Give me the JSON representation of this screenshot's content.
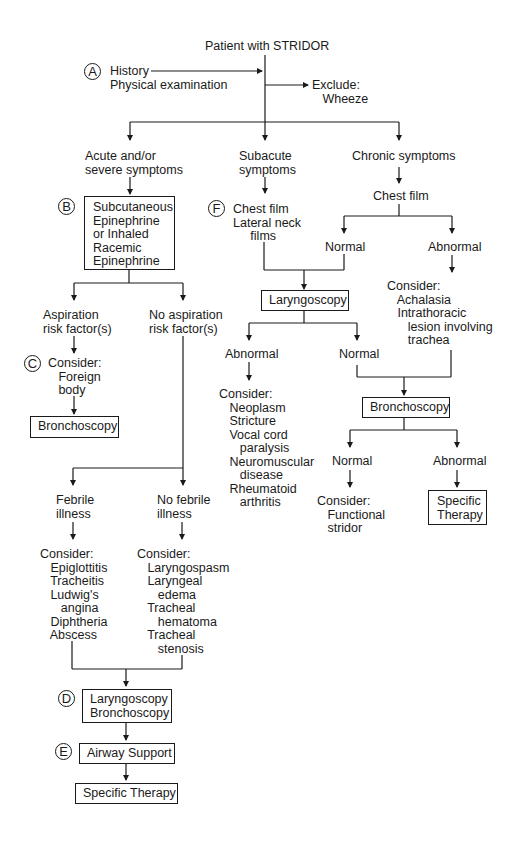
{
  "diagram": {
    "title": "Patient with STRIDOR",
    "step_labels": {
      "A": "A",
      "B": "B",
      "C": "C",
      "D": "D",
      "E": "E",
      "F": "F"
    },
    "top": {
      "history": "History\nPhysical examination",
      "exclude": "Exclude:\n   Wheeze"
    },
    "branches": {
      "acute": "Acute and/or\nsevere symptoms",
      "subacute": "Subacute\nsymptoms",
      "chronic": "Chronic symptoms"
    },
    "acute_path": {
      "treatment_box": "Subcutaneous\nEpinephrine\nor Inhaled\nRacemic\nEpinephrine",
      "aspiration": "Aspiration\nrisk factor(s)",
      "no_aspiration": "No aspiration\nrisk factor(s)",
      "consider_foreign": "Consider:\n   Foreign\n   body",
      "bronchoscopy_box": "Bronchoscopy",
      "febrile": "Febrile\nillness",
      "no_febrile": "No febrile\nillness",
      "febrile_consider": "Consider:\n   Epiglottitis\n   Tracheitis\n   Ludwig's\n      angina\n   Diphtheria\n   Abscess",
      "no_febrile_consider": "Consider:\n   Laryngospasm\n   Laryngeal\n      edema\n   Tracheal\n      hematoma\n   Tracheal\n      stenosis",
      "laryngo_broncho_box": "Laryngoscopy\nBronchoscopy",
      "airway_box": "Airway Support",
      "specific_therapy_box": "Specific Therapy"
    },
    "subacute_path": {
      "films": "Chest film\nLateral neck\n     films",
      "laryngoscopy_box": "Laryngoscopy",
      "abnormal": "Abnormal",
      "normal": "Normal",
      "abnormal_consider": "Consider:\n   Neoplasm\n   Stricture\n   Vocal cord\n      paralysis\n   Neuromuscular\n      disease\n   Rheumatoid\n      arthritis"
    },
    "chronic_path": {
      "chest_film": "Chest film",
      "normal": "Normal",
      "abnormal": "Abnormal",
      "abnormal_consider": "Consider:\n   Achalasia\n   Intrathoracic\n      lesion involving\n      trachea",
      "bronchoscopy_box": "Bronchoscopy",
      "normal2": "Normal",
      "abnormal2": "Abnormal",
      "functional_consider": "Consider:\n   Functional\n   stridor",
      "specific_therapy_box": "Specific\nTherapy"
    }
  }
}
